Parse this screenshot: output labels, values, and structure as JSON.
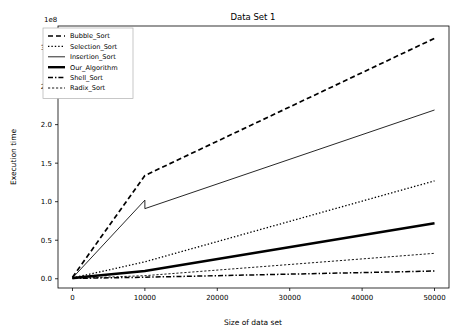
{
  "chart_data": {
    "type": "line",
    "title": "Data Set 1",
    "xlabel": "Size of data set",
    "ylabel": "Execution time",
    "y_offset_text": "1e8",
    "y_offset_multiplier": 100000000,
    "xlim": [
      -2000,
      52000
    ],
    "ylim": [
      -0.12,
      3.28
    ],
    "grid": false,
    "legend_position": "upper left",
    "xticks": [
      0,
      10000,
      20000,
      30000,
      40000,
      50000
    ],
    "xtick_labels": [
      "0",
      "10000",
      "20000",
      "30000",
      "40000",
      "50000"
    ],
    "yticks": [
      0.0,
      0.5,
      1.0,
      1.5,
      2.0,
      2.5,
      3.0
    ],
    "ytick_labels": [
      "0.0",
      "0.5",
      "1.0",
      "1.5",
      "2.0",
      "2.5",
      "3.0"
    ],
    "x": [
      0,
      10000,
      50000
    ],
    "series": [
      {
        "name": "Bubble_Sort",
        "style": "dashed",
        "values": [
          0.02,
          1.34,
          3.12
        ]
      },
      {
        "name": "Selection_Sort",
        "style": "dotted",
        "values": [
          0.01,
          0.22,
          1.27
        ]
      },
      {
        "name": "Insertion_Sort",
        "style": "solid-thin",
        "values": [
          0.01,
          1.02,
          2.19
        ],
        "notch": {
          "x": 10000,
          "value_before": 1.02,
          "value_after": 0.91
        }
      },
      {
        "name": "Our_Algorithm",
        "style": "solid-thick",
        "values": [
          0.01,
          0.1,
          0.72
        ]
      },
      {
        "name": "Shell_Sort",
        "style": "dashdot",
        "values": [
          0.004,
          0.02,
          0.1
        ]
      },
      {
        "name": "Radix_Sort",
        "style": "finely-dashed",
        "values": [
          0.004,
          0.04,
          0.33
        ]
      }
    ]
  },
  "legend": {
    "entries": [
      {
        "label": "Bubble_Sort"
      },
      {
        "label": "Selection_Sort"
      },
      {
        "label": "Insertion_Sort"
      },
      {
        "label": "Our_Algorithm"
      },
      {
        "label": "Shell_Sort"
      },
      {
        "label": "Radix_Sort"
      }
    ]
  }
}
